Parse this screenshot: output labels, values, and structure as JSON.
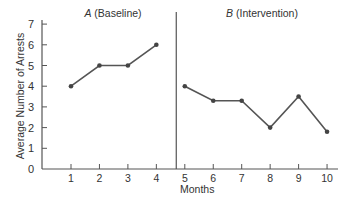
{
  "chart_data": {
    "type": "line",
    "title": "",
    "xlabel": "Months",
    "ylabel": "Average Number of Arrests",
    "xlim": [
      0,
      10.4
    ],
    "ylim": [
      0,
      7
    ],
    "x_ticks": [
      1,
      2,
      3,
      4,
      5,
      6,
      7,
      8,
      9,
      10
    ],
    "y_ticks": [
      0,
      1,
      2,
      3,
      4,
      5,
      6,
      7
    ],
    "grid": false,
    "phase_divider_x": 4.7,
    "phases": [
      {
        "letter": "A",
        "label": "(Baseline)"
      },
      {
        "letter": "B",
        "label": "(Intervention)"
      }
    ],
    "series": [
      {
        "name": "A (Baseline)",
        "x": [
          1,
          2,
          3,
          4
        ],
        "values": [
          4,
          5,
          5,
          6
        ]
      },
      {
        "name": "B (Intervention)",
        "x": [
          5,
          6,
          7,
          8,
          9,
          10
        ],
        "values": [
          4,
          3.3,
          3.3,
          2,
          3.5,
          1.8
        ]
      }
    ]
  },
  "colors": {
    "axis": "#555555",
    "line": "#555555",
    "marker": "#444444",
    "text": "#333333"
  }
}
